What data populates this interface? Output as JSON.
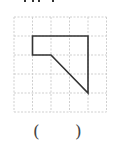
{
  "figure": {
    "grid": {
      "cols": 5,
      "rows": 5,
      "x0": 14,
      "y0": 17,
      "cell": 18.5,
      "line_color": "#d0d0d0",
      "dashed": true
    },
    "shape": {
      "points": [
        [
          32,
          36
        ],
        [
          87,
          36
        ],
        [
          87,
          93
        ],
        [
          51,
          55
        ],
        [
          32,
          55
        ]
      ],
      "stroke": "#333333",
      "stroke_width": 1.6
    }
  },
  "answer": {
    "open_paren": "(",
    "close_paren": ")",
    "blank": ""
  }
}
